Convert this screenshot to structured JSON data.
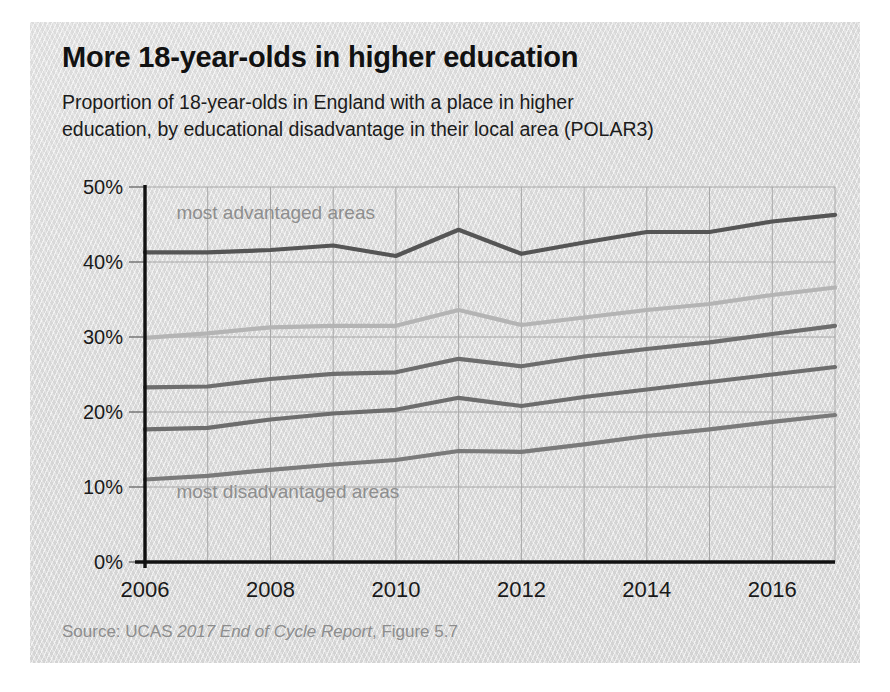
{
  "page": {
    "top_clipped_text": "·                                            ·            ·"
  },
  "figure": {
    "title": "More 18-year-olds in higher education",
    "subtitle_line1": "Proportion of 18-year-olds in England with a place in higher",
    "subtitle_line2": "education, by educational disadvantage in their local area (POLAR3)",
    "source_prefix": "Source: UCAS ",
    "source_italic": "2017 End of Cycle Report",
    "source_suffix": ", Figure 5.7",
    "card_color": "#dedede"
  },
  "chart_data": {
    "type": "line",
    "title": "More 18-year-olds in higher education",
    "subtitle": "Proportion of 18-year-olds in England with a place in higher education, by educational disadvantage in their local area (POLAR3)",
    "xlabel": "",
    "ylabel": "",
    "xlim": [
      2006,
      2017
    ],
    "ylim": [
      0,
      50
    ],
    "grid": true,
    "legend_position": "in-plot annotations",
    "x": [
      2006,
      2007,
      2008,
      2009,
      2010,
      2011,
      2012,
      2013,
      2014,
      2015,
      2016,
      2017
    ],
    "xticks": [
      2006,
      2008,
      2010,
      2012,
      2014,
      2016
    ],
    "xticklabels": [
      "2006",
      "2008",
      "2010",
      "2012",
      "2014",
      "2016"
    ],
    "yticks": [
      0,
      10,
      20,
      30,
      40,
      50
    ],
    "yticklabels": [
      "0%",
      "10%",
      "20%",
      "30%",
      "40%",
      "50%"
    ],
    "annotations": [
      {
        "text": "most advantaged areas",
        "x": 2006.5,
        "y": 45.8
      },
      {
        "text": "most disadvantaged areas",
        "x": 2006.5,
        "y": 8.6
      }
    ],
    "series": [
      {
        "name": "Quintile 5 (most advantaged areas)",
        "color": "#555555",
        "values": [
          41.3,
          41.3,
          41.6,
          42.2,
          40.8,
          44.3,
          41.1,
          42.6,
          44.0,
          44.0,
          45.4,
          46.3
        ]
      },
      {
        "name": "Quintile 4",
        "color": "#b4b4b4",
        "values": [
          29.9,
          30.5,
          31.3,
          31.5,
          31.5,
          33.6,
          31.6,
          32.6,
          33.6,
          34.4,
          35.6,
          36.6
        ]
      },
      {
        "name": "Quintile 3",
        "color": "#6d6d6d",
        "values": [
          23.3,
          23.4,
          24.4,
          25.1,
          25.3,
          27.1,
          26.1,
          27.4,
          28.4,
          29.3,
          30.4,
          31.5
        ]
      },
      {
        "name": "Quintile 2",
        "color": "#6d6d6d",
        "values": [
          17.7,
          17.9,
          19.0,
          19.8,
          20.3,
          21.9,
          20.8,
          22.0,
          23.0,
          24.0,
          25.0,
          26.0
        ]
      },
      {
        "name": "Quintile 1 (most disadvantaged areas)",
        "color": "#7a7a7a",
        "values": [
          11.0,
          11.5,
          12.3,
          13.0,
          13.6,
          14.8,
          14.7,
          15.7,
          16.8,
          17.7,
          18.7,
          19.6
        ]
      }
    ]
  }
}
